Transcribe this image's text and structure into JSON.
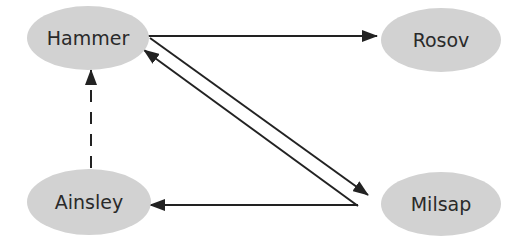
{
  "diagram": {
    "type": "directed-graph",
    "colors": {
      "node_fill": "#d2d2d2",
      "node_text": "#2a2a2a",
      "edge": "#222222",
      "background": "#ffffff"
    },
    "nodes": [
      {
        "id": "hammer",
        "label": "Hammer"
      },
      {
        "id": "rosov",
        "label": "Rosov"
      },
      {
        "id": "ainsley",
        "label": "Ainsley"
      },
      {
        "id": "milsap",
        "label": "Milsap"
      }
    ],
    "edges": [
      {
        "from": "hammer",
        "to": "rosov",
        "style": "solid"
      },
      {
        "from": "hammer",
        "to": "milsap",
        "style": "solid"
      },
      {
        "from": "milsap",
        "to": "hammer",
        "style": "solid"
      },
      {
        "from": "milsap",
        "to": "ainsley",
        "style": "solid"
      },
      {
        "from": "ainsley",
        "to": "hammer",
        "style": "dashed"
      }
    ]
  }
}
